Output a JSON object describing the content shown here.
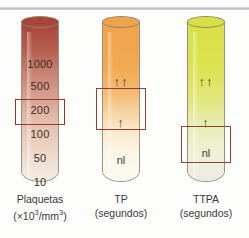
{
  "figure": {
    "background": "#fdfdfc"
  },
  "tubes": [
    {
      "id": "platelets",
      "name": "Plaquetas",
      "caption_line1": "Plaquetas",
      "caption_line2_pre": "(×10",
      "caption_line2_sup": "3",
      "caption_line2_mid": "/mm",
      "caption_line2_sup2": "3",
      "caption_line2_post": ")",
      "gradient_top": "#a8443a",
      "gradient_mid": "#cf9386",
      "gradient_bottom": "#efe2d8",
      "rim_color": "#8d8576",
      "scale": [
        "1000",
        "500",
        "200",
        "100",
        "50",
        "10"
      ],
      "highlight_value": "200",
      "highlight_label": "normal range box"
    },
    {
      "id": "pt",
      "name": "TP",
      "caption_line1": "TP",
      "caption_line2": "(segundos)",
      "gradient_top": "#f0a34a",
      "gradient_mid": "#f6d6a8",
      "gradient_bottom": "#f7f7ec",
      "rim_color": "#a39878",
      "marks": [
        {
          "text": "↑↑",
          "kind": "double-arrow"
        },
        {
          "text": "↑",
          "kind": "single-arrow"
        },
        {
          "text": "nl",
          "kind": "normal"
        }
      ],
      "highlight_label": "elevated range box"
    },
    {
      "id": "aptt",
      "name": "TTPA",
      "caption_line1": "TTPA",
      "caption_line2": "(segundos)",
      "gradient_top": "#d8e044",
      "gradient_mid": "#e2e79a",
      "gradient_bottom": "#eceddb",
      "rim_color": "#9aa070",
      "marks": [
        {
          "text": "↑↑",
          "kind": "double-arrow"
        },
        {
          "text": "↑",
          "kind": "single-arrow"
        },
        {
          "text": "nl",
          "kind": "normal"
        }
      ],
      "highlight_label": "normal range box"
    }
  ],
  "colors": {
    "highlight_border": "#8e3a2c",
    "text": "#3a3a3a",
    "rule": "#b9b9b9"
  }
}
